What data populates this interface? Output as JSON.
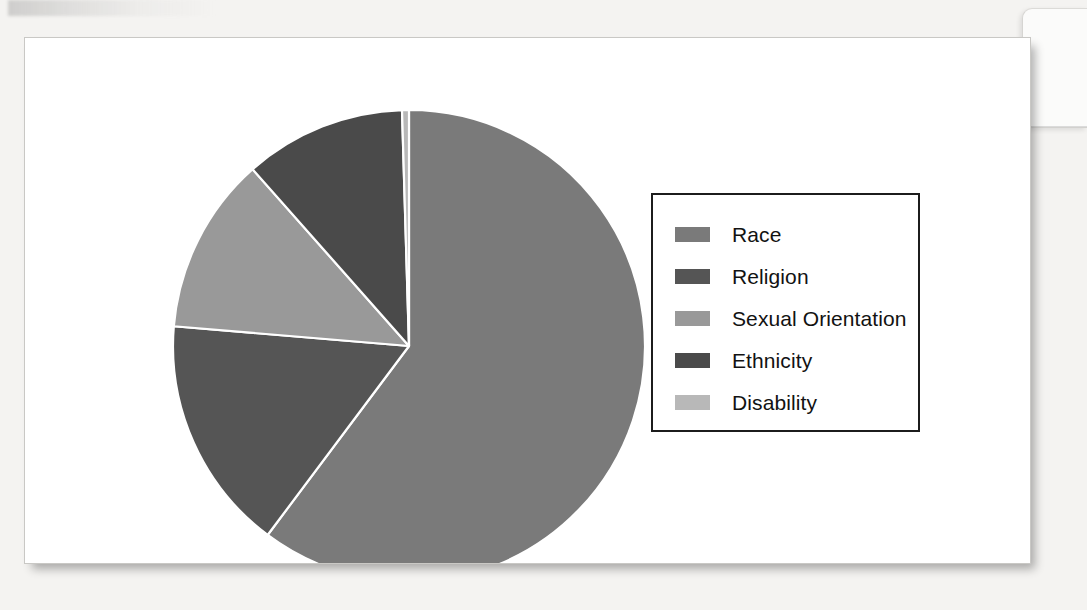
{
  "page": {
    "background_color": "#f4f3f1",
    "card_background": "#ffffff"
  },
  "legend": {
    "position": "right",
    "border_color": "#1c1c1c",
    "items": [
      {
        "label": "Race",
        "color": "#7a7a7a"
      },
      {
        "label": "Religion",
        "color": "#555555"
      },
      {
        "label": "Sexual Orientation",
        "color": "#999999"
      },
      {
        "label": "Ethnicity",
        "color": "#4a4a4a"
      },
      {
        "label": "Disability",
        "color": "#b8b8b8"
      }
    ]
  },
  "chart_data": {
    "type": "pie",
    "title": "",
    "subtitle": "",
    "xlabel": "",
    "ylabel": "",
    "grid": false,
    "legend_position": "right",
    "start_angle_deg": 0,
    "direction": "clockwise",
    "center": {
      "x": 384,
      "y": 308
    },
    "radius": 236,
    "slice_separator_color": "#ffffff",
    "categories": [
      "Race",
      "Religion",
      "Sexual Orientation",
      "Ethnicity",
      "Disability"
    ],
    "values": [
      60.2,
      16.1,
      12.1,
      11.1,
      0.5
    ],
    "unit": "percent",
    "colors": [
      "#7a7a7a",
      "#555555",
      "#999999",
      "#4a4a4a",
      "#b8b8b8"
    ],
    "slices": [
      {
        "label": "Race",
        "value": 60.2,
        "color": "#7a7a7a",
        "start_deg": 0.0,
        "end_deg": 216.8
      },
      {
        "label": "Religion",
        "value": 16.1,
        "color": "#555555",
        "start_deg": 216.8,
        "end_deg": 274.8
      },
      {
        "label": "Sexual Orientation",
        "value": 12.1,
        "color": "#999999",
        "start_deg": 274.8,
        "end_deg": 318.5
      },
      {
        "label": "Ethnicity",
        "value": 11.1,
        "color": "#4a4a4a",
        "start_deg": 318.5,
        "end_deg": 358.3
      },
      {
        "label": "Disability",
        "value": 0.5,
        "color": "#b8b8b8",
        "start_deg": 358.3,
        "end_deg": 360.0
      }
    ]
  }
}
